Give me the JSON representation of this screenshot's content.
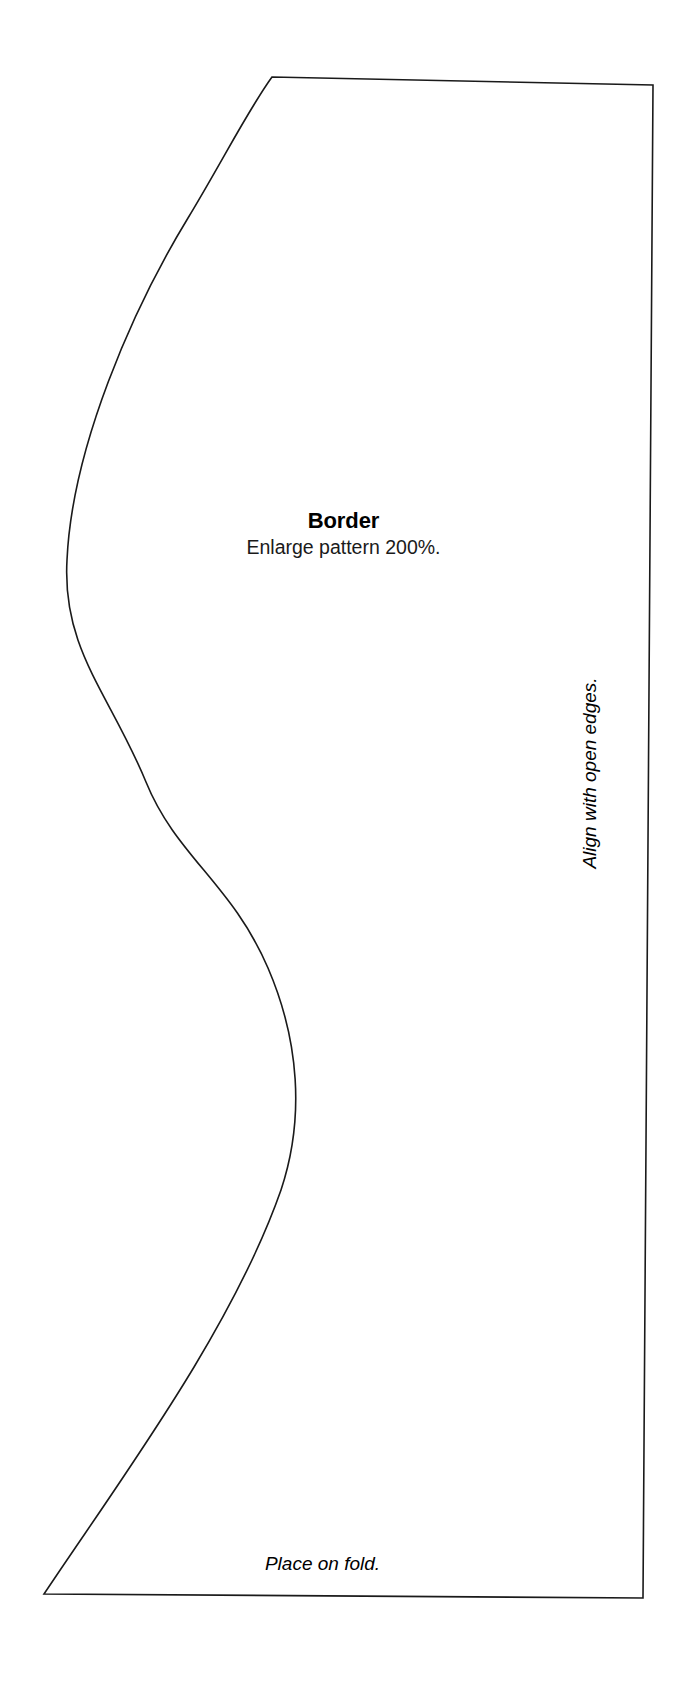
{
  "document": {
    "kind": "sewing-pattern-template",
    "piece_name": "Border"
  },
  "annotations": {
    "title": "Border",
    "scale_instruction": "Enlarge pattern 200%.",
    "right_edge_note": "Align with open edges.",
    "bottom_edge_note": "Place on fold."
  },
  "style": {
    "line_color": "#1a1a1a",
    "background": "#ffffff",
    "text_color": "#000000"
  },
  "outline": {
    "description": "Closed pattern piece: near-straight top edge, straight right edge, straight bottom edge, and a long S-curve forming the left edge.",
    "line_width": 1.6,
    "points": {
      "top_left_curve_start": [
        272,
        77
      ],
      "top_right_corner": [
        653,
        85
      ],
      "bottom_right_corner": [
        643,
        1598
      ],
      "bottom_left_corner": [
        44,
        1594
      ],
      "curve_left_extreme": [
        67,
        560
      ],
      "curve_inflection": [
        170,
        830
      ],
      "curve_right_extreme": [
        293,
        1115
      ]
    },
    "path": "M 272 77 L 653 85 L 643 1598 L 44 1594 C 120 1480 232 1330 281 1190 C 305 1118 299 1040 268 968 C 232 884 176 856 146 782 C 110 694 62 650 67 560 C 72 448 132 310 188 218 C 222 162 248 110 272 77 Z"
  }
}
